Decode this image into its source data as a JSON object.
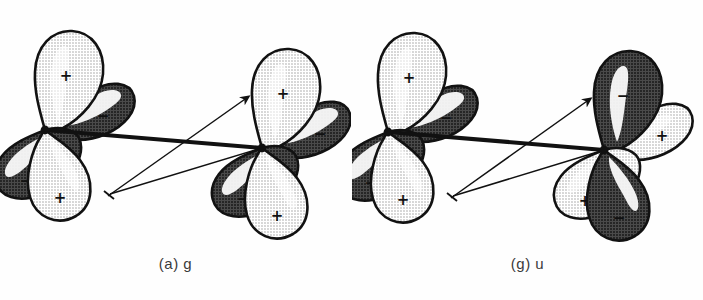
{
  "figure": {
    "background_color": "#ffffff",
    "width": 703,
    "height": 300
  },
  "colors": {
    "positive_lobe_fill": "#dcdcdc",
    "negative_lobe_fill": "#6e6e6e",
    "outline": "#121212",
    "highlight": "#ffffff",
    "bond_line": "#111111",
    "caption_text": "#3a3a3a"
  },
  "panels": [
    {
      "id": "panel-g",
      "caption": "(a) g",
      "symmetry": "gerade",
      "atoms": [
        {
          "id": "left-atom",
          "position": "left",
          "lobes": [
            {
              "direction": "up",
              "sign": "+",
              "shade": "light"
            },
            {
              "direction": "upper-right",
              "sign": "−",
              "shade": "dark"
            },
            {
              "direction": "lower-left",
              "sign": "−",
              "shade": "dark"
            },
            {
              "direction": "down",
              "sign": "+",
              "shade": "light"
            }
          ]
        },
        {
          "id": "right-atom",
          "position": "right",
          "lobes": [
            {
              "direction": "up",
              "sign": "+",
              "shade": "light"
            },
            {
              "direction": "upper-right",
              "sign": "−",
              "shade": "dark"
            },
            {
              "direction": "lower-left",
              "sign": "−",
              "shade": "dark"
            },
            {
              "direction": "down",
              "sign": "+",
              "shade": "light"
            }
          ]
        }
      ],
      "connectors": [
        {
          "type": "bond",
          "style": "thick",
          "from": "left-nucleus",
          "to": "right-nucleus"
        },
        {
          "type": "overlap-arrow",
          "style": "thin",
          "from": "left-lower-lobe",
          "to": "right-upper-lobe",
          "arrowhead": "end"
        },
        {
          "type": "overlap-arrow",
          "style": "thin",
          "from": "right-nucleus",
          "to": "left-lower-lobe",
          "arrowhead": "end"
        }
      ]
    },
    {
      "id": "panel-u",
      "caption": "(g) u",
      "symmetry": "ungerade",
      "atoms": [
        {
          "id": "left-atom",
          "position": "left",
          "lobes": [
            {
              "direction": "up",
              "sign": "+",
              "shade": "light"
            },
            {
              "direction": "upper-right",
              "sign": "−",
              "shade": "dark"
            },
            {
              "direction": "lower-left",
              "sign": "−",
              "shade": "dark"
            },
            {
              "direction": "down",
              "sign": "+",
              "shade": "light"
            }
          ]
        },
        {
          "id": "right-atom",
          "position": "right",
          "lobes": [
            {
              "direction": "up",
              "sign": "−",
              "shade": "dark"
            },
            {
              "direction": "upper-right",
              "sign": "+",
              "shade": "light"
            },
            {
              "direction": "lower-left",
              "sign": "+",
              "shade": "light"
            },
            {
              "direction": "down",
              "sign": "−",
              "shade": "dark"
            }
          ]
        }
      ],
      "connectors": [
        {
          "type": "bond",
          "style": "thick",
          "from": "left-nucleus",
          "to": "right-nucleus"
        },
        {
          "type": "overlap-arrow",
          "style": "thin",
          "from": "left-lower-lobe",
          "to": "right-upper-lobe",
          "arrowhead": "end"
        },
        {
          "type": "overlap-arrow",
          "style": "thin",
          "from": "right-nucleus",
          "to": "left-lower-lobe",
          "arrowhead": "end"
        }
      ]
    }
  ],
  "signs": {
    "plus": "+",
    "minus": "−"
  }
}
